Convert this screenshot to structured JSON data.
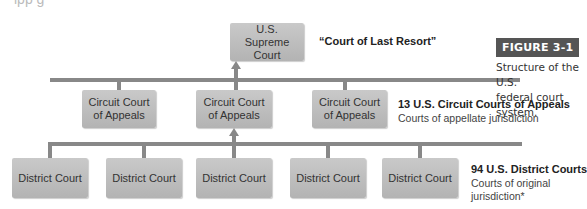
{
  "figure": {
    "tag": "FIGURE 3-1",
    "caption_line1": "Structure of the U.S.",
    "caption_line2": "federal court system."
  },
  "top_cropped_text": "ipp   g",
  "supreme": {
    "line1": "U.S.",
    "line2": "Supreme Court",
    "label": "“Court of Last Resort”"
  },
  "circuit": {
    "boxes": [
      {
        "line1": "Circuit Court",
        "line2": "of Appeals"
      },
      {
        "line1": "Circuit Court",
        "line2": "of Appeals"
      },
      {
        "line1": "Circuit Court",
        "line2": "of Appeals"
      }
    ],
    "label": "13 U.S. Circuit Courts of Appeals",
    "sublabel": "Courts of appellate jurisdiction"
  },
  "district": {
    "boxes": [
      "District Court",
      "District Court",
      "District Court",
      "District Court",
      "District Court"
    ],
    "label": "94 U.S. District Courts",
    "sublabel_line1": "Courts of original",
    "sublabel_line2": "jurisdiction*"
  },
  "colors": {
    "box": "#bdbdbd",
    "connector": "#888888",
    "figure_tag": "#555555"
  }
}
